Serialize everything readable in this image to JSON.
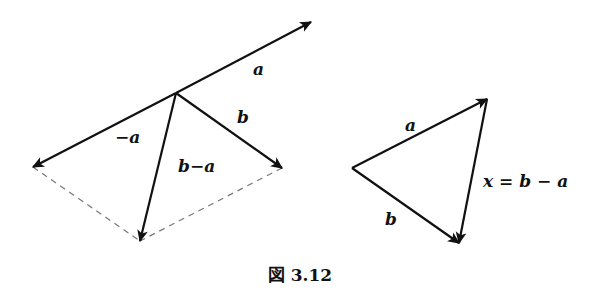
{
  "figure": {
    "caption": "図 3.12",
    "left_diagram": {
      "origin": [
        176,
        93
      ],
      "vectors": [
        {
          "name": "a",
          "label": "a",
          "from": [
            176,
            93
          ],
          "to": [
            311,
            22
          ],
          "label_pos": [
            253,
            75
          ]
        },
        {
          "name": "neg-a",
          "label": "−a",
          "from": [
            176,
            93
          ],
          "to": [
            33,
            167
          ],
          "label_pos": [
            115,
            143
          ]
        },
        {
          "name": "b",
          "label": "b",
          "from": [
            176,
            93
          ],
          "to": [
            282,
            168
          ],
          "label_pos": [
            237,
            123
          ]
        },
        {
          "name": "b-minus-a",
          "label": "b−a",
          "from": [
            176,
            93
          ],
          "to": [
            140,
            241
          ],
          "label_pos": [
            178,
            172
          ]
        }
      ],
      "dashed_edges": [
        {
          "from": [
            33,
            167
          ],
          "to": [
            140,
            241
          ]
        },
        {
          "from": [
            282,
            168
          ],
          "to": [
            140,
            241
          ]
        }
      ]
    },
    "right_diagram": {
      "vertices": {
        "left": [
          352,
          168
        ],
        "top": [
          487,
          99
        ],
        "bottom": [
          459,
          243
        ]
      },
      "vectors": [
        {
          "name": "a",
          "label": "a",
          "from": [
            352,
            168
          ],
          "to": [
            487,
            99
          ],
          "label_pos": [
            405,
            131
          ]
        },
        {
          "name": "b",
          "label": "b",
          "from": [
            352,
            168
          ],
          "to": [
            459,
            243
          ],
          "label_pos": [
            385,
            225
          ]
        },
        {
          "name": "x",
          "label": "x = b − a",
          "from": [
            487,
            99
          ],
          "to": [
            459,
            243
          ],
          "label_pos": [
            483,
            187
          ]
        }
      ]
    },
    "colors": {
      "stroke": "#111111",
      "dashed": "#777777",
      "background": "#ffffff"
    }
  }
}
